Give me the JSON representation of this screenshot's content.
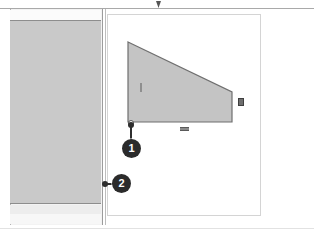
{
  "viewport": {
    "name": "cad-sketch-viewport",
    "background_color": "#ffffff",
    "top_rule_color": "#a9a9a9",
    "top_marker": {
      "name": "top-center-marker",
      "shape": "down-triangle",
      "color": "#555555"
    }
  },
  "left_panel": {
    "name": "selected-wall-panel",
    "fill_color": "#c9c9c9",
    "band_top_color": "#fbfbfb",
    "band_bottom_color": "#ededed",
    "border_color": "#9c9c9c"
  },
  "divider": {
    "name": "panel-divider",
    "color": "#bdbdbd"
  },
  "draw_region": {
    "name": "drawing-region",
    "border_color": "#d4d4d4",
    "fill_color": "#ffffff"
  },
  "shape": {
    "name": "trapezoid-wedge",
    "type": "polygon",
    "fill_color": "#c4c4c4",
    "stroke_color": "#6f6f6f",
    "vertices": [
      [
        0,
        0
      ],
      [
        104,
        50
      ],
      [
        104,
        80
      ],
      [
        0,
        80
      ]
    ],
    "selected": true
  },
  "handles": [
    {
      "name": "edge-handle-right",
      "type": "square",
      "color": "#6e6e6e"
    },
    {
      "name": "edge-handle-bottom",
      "type": "dash",
      "color": "#8a8a8a"
    },
    {
      "name": "edge-handle-left",
      "type": "tick",
      "color": "#8f8f8f"
    },
    {
      "name": "vertex-handle-bottom-left",
      "type": "circle",
      "color": "#555555"
    }
  ],
  "callouts": [
    {
      "id": "callout-1",
      "label": "1",
      "leader": "vertical",
      "anchor": "shape-bottom-left-vertex",
      "badge_color": "#2b2b2b",
      "text_color": "#ffffff"
    },
    {
      "id": "callout-2",
      "label": "2",
      "leader": "horizontal",
      "anchor": "panel-right-edge",
      "badge_color": "#2b2b2b",
      "text_color": "#ffffff"
    }
  ]
}
